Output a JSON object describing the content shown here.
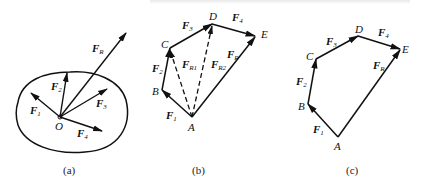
{
  "top_text": "(partially cut-off caption line)",
  "panels": [
    {
      "caption": "(a)",
      "origin_label": "O",
      "forces": [
        {
          "name": "F",
          "sub": "1"
        },
        {
          "name": "F",
          "sub": "2"
        },
        {
          "name": "F",
          "sub": "3"
        },
        {
          "name": "F",
          "sub": "4"
        },
        {
          "name": "F",
          "sub": "R"
        }
      ]
    },
    {
      "caption": "(b)",
      "points": [
        "A",
        "B",
        "C",
        "D",
        "E"
      ],
      "forces": [
        {
          "name": "F",
          "sub": "1"
        },
        {
          "name": "F",
          "sub": "2"
        },
        {
          "name": "F",
          "sub": "3"
        },
        {
          "name": "F",
          "sub": "4"
        },
        {
          "name": "F",
          "sub": "R1"
        },
        {
          "name": "F",
          "sub": "R2"
        },
        {
          "name": "F",
          "sub": "R"
        }
      ]
    },
    {
      "caption": "(c)",
      "points": [
        "A",
        "B",
        "C",
        "D",
        "E"
      ],
      "forces": [
        {
          "name": "F",
          "sub": "1"
        },
        {
          "name": "F",
          "sub": "2"
        },
        {
          "name": "F",
          "sub": "3"
        },
        {
          "name": "F",
          "sub": "4"
        },
        {
          "name": "F",
          "sub": "R"
        }
      ]
    }
  ]
}
